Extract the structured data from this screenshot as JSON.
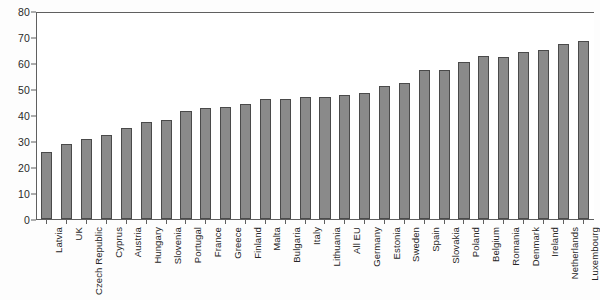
{
  "chart_data": {
    "type": "bar",
    "title": "",
    "subtitle": "",
    "xlabel": "",
    "ylabel": "",
    "ylim": [
      0,
      80
    ],
    "ytick_step": 10,
    "yticks": [
      0,
      10,
      20,
      30,
      40,
      50,
      60,
      70,
      80
    ],
    "grid": false,
    "legend": false,
    "legend_position": "none",
    "orientation": "vertical",
    "sorted": "ascending",
    "bar_color": "#8a8a8a",
    "bar_edge_color": "#4a4a4a",
    "axis_color": "#5f5f5f",
    "background_color": "#ffffff",
    "categories": [
      "Latvia",
      "UK",
      "Czech Republic",
      "Cyprus",
      "Austria",
      "Hungary",
      "Slovenia",
      "Portugal",
      "France",
      "Greece",
      "Finland",
      "Malta",
      "Bulgaria",
      "Italy",
      "Lithuania",
      "All EU",
      "Germany",
      "Estonia",
      "Sweden",
      "Spain",
      "Slovakia",
      "Poland",
      "Belgium",
      "Romania",
      "Denmark",
      "Ireland",
      "Netherlands",
      "Luxembourg"
    ],
    "values": [
      26,
      29,
      31,
      32.5,
      35.5,
      37.5,
      38.5,
      42,
      43,
      43.5,
      44.5,
      46.5,
      46.5,
      47.5,
      47.5,
      48,
      49,
      51.5,
      53,
      58,
      58,
      61,
      63.5,
      63,
      65,
      65.5,
      68,
      69
    ]
  }
}
